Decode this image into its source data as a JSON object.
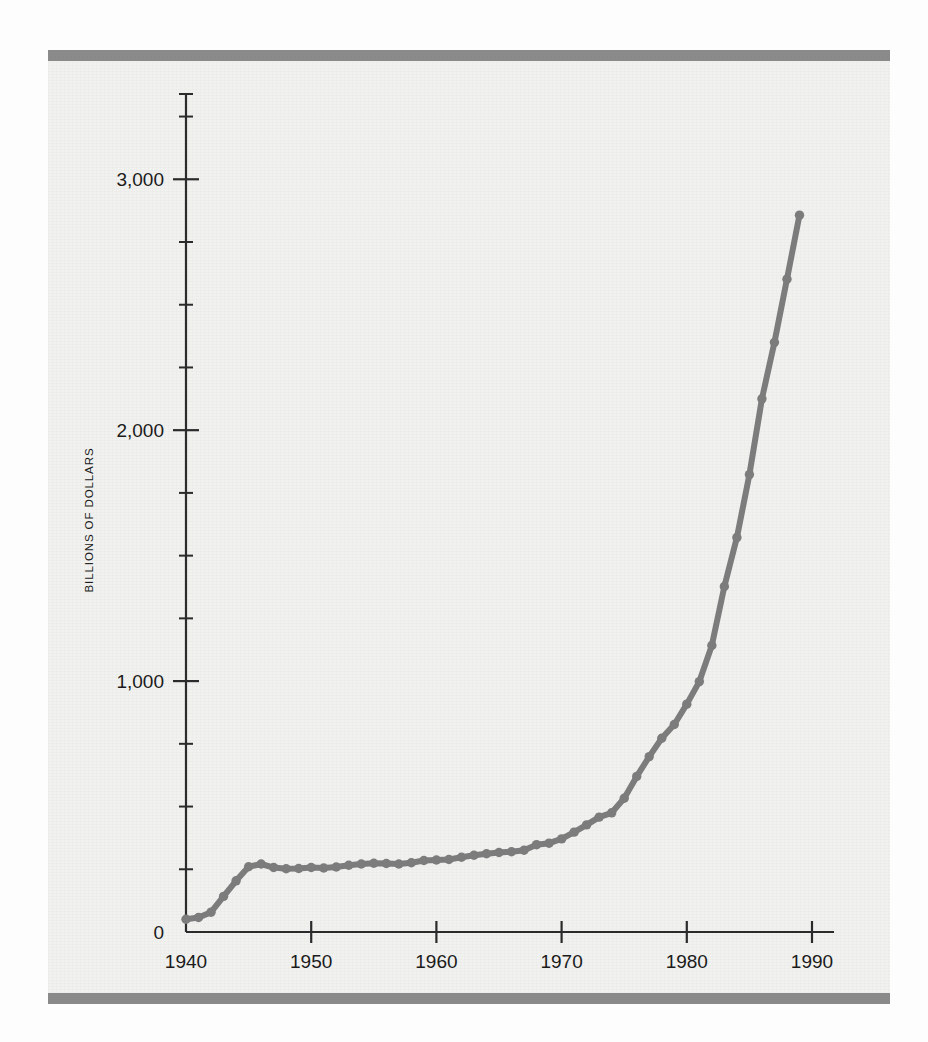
{
  "figure": {
    "background_color": "#f1f1ef",
    "page_color": "#fdfdfd",
    "rule_color": "#8a8a8a",
    "top_rule_name": "top-rule",
    "bottom_rule_name": "bottom-rule"
  },
  "axes": {
    "y_axis_title": "BILLIONS OF DOLLARS",
    "y_tick_labels": [
      "0",
      "1,000",
      "2,000",
      "3,000"
    ],
    "x_tick_labels": [
      "1940",
      "1950",
      "1960",
      "1970",
      "1980",
      "1990"
    ]
  },
  "chart_data": {
    "type": "line",
    "title": "",
    "subtitle": "",
    "xlabel": "",
    "ylabel": "BILLIONS OF DOLLARS",
    "xlim": [
      1940,
      1990
    ],
    "ylim": [
      0,
      3300
    ],
    "xticks": [
      1940,
      1950,
      1960,
      1970,
      1980,
      1990
    ],
    "yticks": [
      0,
      1000,
      2000,
      3000
    ],
    "ytick_labels": [
      "0",
      "1,000",
      "2,000",
      "3,000"
    ],
    "y_minor_tick_interval": 250,
    "grid": false,
    "legend": null,
    "legend_position": "none",
    "line_color": "#7c7c7c",
    "marker": "circle",
    "marker_size": 7,
    "line_width": 6,
    "annotations": [],
    "series": [
      {
        "name": "Gross federal debt",
        "x": [
          1940,
          1941,
          1942,
          1943,
          1944,
          1945,
          1946,
          1947,
          1948,
          1949,
          1950,
          1951,
          1952,
          1953,
          1954,
          1955,
          1956,
          1957,
          1958,
          1959,
          1960,
          1961,
          1962,
          1963,
          1964,
          1965,
          1966,
          1967,
          1968,
          1969,
          1970,
          1971,
          1972,
          1973,
          1974,
          1975,
          1976,
          1977,
          1978,
          1979,
          1980,
          1981,
          1982,
          1983,
          1984,
          1985,
          1986,
          1987,
          1988,
          1989
        ],
        "values": [
          51,
          58,
          79,
          142,
          204,
          260,
          271,
          257,
          252,
          253,
          257,
          255,
          259,
          266,
          271,
          274,
          273,
          271,
          276,
          285,
          287,
          289,
          298,
          306,
          312,
          317,
          320,
          326,
          348,
          354,
          371,
          398,
          427,
          458,
          475,
          533,
          620,
          699,
          772,
          827,
          908,
          998,
          1142,
          1377,
          1572,
          1823,
          2125,
          2350,
          2602,
          2857
        ]
      }
    ]
  }
}
